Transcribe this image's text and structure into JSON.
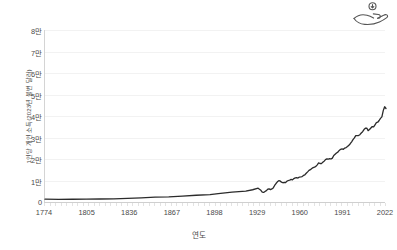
{
  "icon": {
    "name": "hand-receiving-money-icon",
    "label": "income"
  },
  "axes": {
    "y_title": "1인당 개인 소득(2023년 불변 달러)",
    "x_title": "연도",
    "y_tick_labels": [
      "8만",
      "7만",
      "6만",
      "5만",
      "4만",
      "3만",
      "2만",
      "1만",
      "0"
    ],
    "y_tick_values": [
      80000,
      70000,
      60000,
      50000,
      40000,
      30000,
      20000,
      10000,
      0
    ],
    "x_tick_labels": [
      "1774",
      "1805",
      "1836",
      "1867",
      "1898",
      "1929",
      "1960",
      "1991",
      "2022"
    ],
    "x_tick_values": [
      1774,
      1805,
      1836,
      1867,
      1898,
      1929,
      1960,
      1991,
      2022
    ]
  },
  "style": {
    "line_color": "#2b2b2b",
    "grid_color": "#f2f2f2",
    "axis_color": "#cfcfcf",
    "text_color": "#4a4a4a",
    "background": "#ffffff"
  },
  "chart_data": {
    "type": "line",
    "title": "",
    "subtitle": "",
    "xlabel": "연도",
    "ylabel": "1인당 개인 소득(2023년 불변 달러)",
    "xlim": [
      1774,
      2022
    ],
    "ylim": [
      0,
      80000
    ],
    "grid": true,
    "legend": null,
    "series": [
      {
        "name": "1인당 개인 소득",
        "x": [
          1774,
          1784,
          1794,
          1804,
          1814,
          1824,
          1834,
          1844,
          1854,
          1864,
          1874,
          1884,
          1894,
          1900,
          1905,
          1910,
          1915,
          1920,
          1925,
          1929,
          1930,
          1931,
          1932,
          1933,
          1934,
          1935,
          1936,
          1937,
          1938,
          1939,
          1940,
          1941,
          1942,
          1943,
          1944,
          1945,
          1946,
          1947,
          1948,
          1949,
          1950,
          1951,
          1952,
          1953,
          1954,
          1955,
          1956,
          1957,
          1958,
          1959,
          1960,
          1961,
          1962,
          1963,
          1964,
          1965,
          1966,
          1967,
          1968,
          1969,
          1970,
          1971,
          1972,
          1973,
          1974,
          1975,
          1976,
          1977,
          1978,
          1979,
          1980,
          1981,
          1982,
          1983,
          1984,
          1985,
          1986,
          1987,
          1988,
          1989,
          1990,
          1991,
          1992,
          1993,
          1994,
          1995,
          1996,
          1997,
          1998,
          1999,
          2000,
          2001,
          2002,
          2003,
          2004,
          2005,
          2006,
          2007,
          2008,
          2009,
          2010,
          2011,
          2012,
          2013,
          2014,
          2015,
          2016,
          2017,
          2018,
          2019,
          2020,
          2021,
          2022
        ],
        "y": [
          1300,
          1250,
          1280,
          1350,
          1400,
          1500,
          1700,
          1950,
          2250,
          2400,
          2750,
          3150,
          3400,
          3900,
          4250,
          4550,
          4800,
          5100,
          5700,
          6400,
          5900,
          5450,
          4600,
          4450,
          4900,
          5300,
          5950,
          6100,
          5750,
          6100,
          6550,
          7700,
          8600,
          9400,
          9900,
          9800,
          9200,
          8950,
          9150,
          9050,
          9700,
          10000,
          10200,
          10500,
          10300,
          10900,
          11200,
          11300,
          11150,
          11600,
          11700,
          11850,
          12350,
          12650,
          13350,
          14000,
          14700,
          15050,
          15600,
          16000,
          16250,
          16550,
          17300,
          18200,
          17900,
          17850,
          18450,
          19000,
          19700,
          20050,
          19900,
          20200,
          20000,
          20400,
          21600,
          22200,
          22800,
          23200,
          24000,
          24500,
          24700,
          24500,
          25100,
          25300,
          25800,
          26400,
          27100,
          28000,
          29000,
          29800,
          30900,
          30900,
          30900,
          31300,
          32100,
          32700,
          33700,
          34300,
          34400,
          33200,
          33700,
          34400,
          35100,
          34900,
          35900,
          36900,
          37100,
          37900,
          38900,
          39600,
          42500,
          44300,
          43500
        ]
      }
    ]
  }
}
